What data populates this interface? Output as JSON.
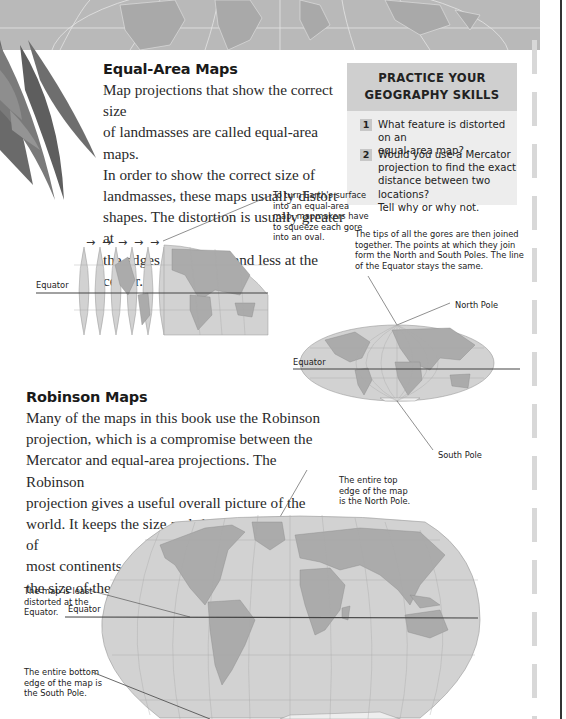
{
  "banner": {
    "description": "grayscale world map banner strip"
  },
  "equal_area": {
    "heading": "Equal-Area Maps",
    "lines": [
      "Map projections that show the correct size",
      "of landmasses are called equal-area maps.",
      "In order to show the correct size of",
      "landmasses, these maps usually distort",
      "shapes. The distortion is usually greater at",
      "the edges of the map and less at the center."
    ]
  },
  "practice": {
    "title_lines": [
      "PRACTICE YOUR",
      "GEOGRAPHY SKILLS"
    ],
    "questions": [
      {
        "number": "1",
        "lines": [
          "What feature is distorted on an",
          "equal-area map?"
        ]
      },
      {
        "number": "2",
        "lines": [
          "Would you use a Mercator",
          "projection to find the exact",
          "distance between two locations?",
          "Tell why or why not."
        ]
      }
    ]
  },
  "gores_diagram": {
    "caption_lines": [
      "To turn Earth's surface",
      "into an equal-area",
      "map, mapmakers have",
      "to squeeze each gore",
      "into an oval."
    ],
    "equator_label": "Equator",
    "arrows": [
      "→",
      "→",
      "→",
      "→",
      "→"
    ]
  },
  "oval_diagram": {
    "caption_lines": [
      "The tips of all the gores are then joined",
      "together. The points at which they join",
      "form the North and South Poles. The line",
      "of the Equator stays the same."
    ],
    "north_pole_label": "North Pole",
    "south_pole_label": "South Pole",
    "equator_label": "Equator"
  },
  "robinson": {
    "heading": "Robinson Maps",
    "lines": [
      "Many of the maps in this book use the Robinson",
      "projection, which is a compromise between the",
      "Mercator and equal-area projections. The Robinson",
      "projection gives a useful overall picture of the",
      "world. It keeps the size and shape relationships of",
      "most continents and oceans, but distorts",
      "the size of the polar regions."
    ],
    "top_edge_caption": [
      "The entire top",
      "edge of the map",
      "is the North Pole."
    ],
    "equator_caption": [
      "The map is least",
      "distorted at the",
      "Equator."
    ],
    "equator_label": "Equator",
    "bottom_edge_caption": [
      "The entire bottom",
      "edge of the map is",
      "the South Pole."
    ]
  },
  "colors": {
    "ocean": "#d2d2d2",
    "land": "#a9a9a9",
    "banner": "#b8b8b8",
    "practice_header": "#cfcfcf",
    "practice_body": "#ededed"
  }
}
